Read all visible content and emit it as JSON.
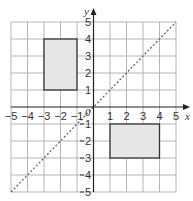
{
  "diagram": {
    "axes": {
      "x_label": "x",
      "y_label": "y",
      "origin_label": "0",
      "x_ticks": [
        "−5",
        "−4",
        "−3",
        "−2",
        "−1",
        "1",
        "2",
        "3",
        "4",
        "5"
      ],
      "y_ticks_pos": [
        "1",
        "2",
        "3",
        "4",
        "5"
      ],
      "y_ticks_neg": [
        "1",
        "2",
        "3",
        "4",
        "5"
      ],
      "range": [
        -5,
        5
      ]
    },
    "shapes": [
      {
        "name": "rectangle-A",
        "corners": [
          [
            -3,
            1
          ],
          [
            -1,
            1
          ],
          [
            -1,
            4
          ],
          [
            -3,
            4
          ]
        ],
        "fill": "#e6e6e6",
        "stroke": "#333333"
      },
      {
        "name": "rectangle-B",
        "corners": [
          [
            1,
            -1
          ],
          [
            4,
            -1
          ],
          [
            4,
            -3
          ],
          [
            1,
            -3
          ]
        ],
        "fill": "#e6e6e6",
        "stroke": "#333333"
      }
    ],
    "mirror_line": {
      "equation": "y = x",
      "style": "dashed",
      "from": [
        -5,
        -5
      ],
      "to": [
        5,
        5
      ]
    },
    "colors": {
      "grid": "#b0b0b0",
      "axis": "#222222",
      "shape_fill": "#e6e6e6"
    }
  }
}
